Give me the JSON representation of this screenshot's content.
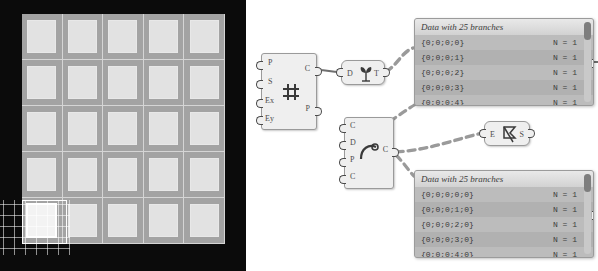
{
  "app": {
    "context": "grasshopper-canvas",
    "viewport_label": "rhino-viewport"
  },
  "viewport": {
    "grid": {
      "rows": 5,
      "cols": 5,
      "total_cells": 25,
      "selected_cell": {
        "row": 4,
        "col": 0
      },
      "background_color": "#0b0b0b",
      "surface_color": "#a3a3a3",
      "cell_color": "#e2e2e2",
      "gridline_color": "#ffffff"
    }
  },
  "nodes": [
    {
      "id": "node-rectangular-grid",
      "icon": "grid-icon",
      "inputs": [
        {
          "name": "P",
          "label": "P"
        },
        {
          "name": "S",
          "label": "S"
        },
        {
          "name": "Ex",
          "label": "Ex"
        },
        {
          "name": "Ey",
          "label": "Ey"
        }
      ],
      "outputs": [
        {
          "name": "C",
          "label": "C"
        },
        {
          "name": "P",
          "label": "P"
        }
      ]
    },
    {
      "id": "node-deconstruct",
      "icon": "sprout-icon",
      "inputs": [
        {
          "name": "D",
          "label": "D"
        }
      ],
      "outputs": [
        {
          "name": "T",
          "label": "T"
        }
      ]
    },
    {
      "id": "node-curve",
      "icon": "arc-icon",
      "inputs": [
        {
          "name": "C",
          "label": "C"
        },
        {
          "name": "D",
          "label": "D"
        },
        {
          "name": "P",
          "label": "P"
        },
        {
          "name": "C2",
          "label": "C"
        }
      ],
      "outputs": [
        {
          "name": "C",
          "label": "C"
        }
      ]
    },
    {
      "id": "node-explode",
      "icon": "flag-icon",
      "inputs": [
        {
          "name": "E",
          "label": "E"
        }
      ],
      "outputs": [
        {
          "name": "S",
          "label": "S"
        }
      ]
    }
  ],
  "panels": [
    {
      "id": "panel-upper",
      "title": "Data with 25 branches",
      "rows": [
        {
          "path": "{0;0;0;0}",
          "count": "N = 1"
        },
        {
          "path": "{0;0;0;1}",
          "count": "N = 1"
        },
        {
          "path": "{0;0;0;2}",
          "count": "N = 1"
        },
        {
          "path": "{0;0;0;3}",
          "count": "N = 1"
        },
        {
          "path": "{0;0;0;4}",
          "count": "N = 1"
        }
      ]
    },
    {
      "id": "panel-lower",
      "title": "Data with 25 branches",
      "rows": [
        {
          "path": "{0;0;0;0;0}",
          "count": "N = 1"
        },
        {
          "path": "{0;0;0;1;0}",
          "count": "N = 1"
        },
        {
          "path": "{0;0;0;2;0}",
          "count": "N = 1"
        },
        {
          "path": "{0;0;0;3;0}",
          "count": "N = 1"
        },
        {
          "path": "{0;0;0;4;0}",
          "count": "N = 1"
        }
      ]
    }
  ],
  "colors": {
    "node_fill": "#efefef",
    "node_border": "#9a9a9a",
    "panel_fill": "#b6b6b6",
    "wire_color": "#8d8d8d"
  }
}
